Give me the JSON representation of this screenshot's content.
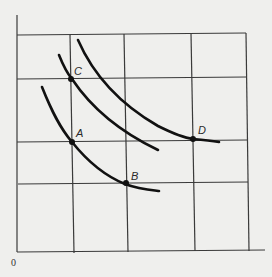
{
  "diagram": {
    "origin_label": "0",
    "points": [
      {
        "label": "A",
        "x": 72,
        "y": 142
      },
      {
        "label": "B",
        "x": 125,
        "y": 184
      },
      {
        "label": "C",
        "x": 72,
        "y": 79
      },
      {
        "label": "D",
        "x": 193,
        "y": 139
      }
    ],
    "colors": {
      "background": "#efefed",
      "grid": "#333333",
      "curve": "#111111"
    }
  }
}
